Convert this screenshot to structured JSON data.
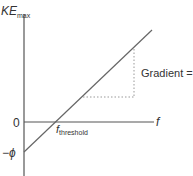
{
  "diagram": {
    "y_axis": {
      "label_main": "KE",
      "label_sub": "max",
      "ticks": [
        {
          "label": "0",
          "value": 0
        },
        {
          "label": "−ϕ",
          "value": "-phi"
        }
      ]
    },
    "x_axis": {
      "label": "f",
      "threshold_main": "f",
      "threshold_sub": "threshold"
    },
    "line": {
      "description": "KE_max = h f − ϕ",
      "y_intercept": "−ϕ",
      "x_intercept": "f_threshold"
    },
    "gradient_annotation": {
      "text": "Gradient = ",
      "symbol": "h"
    },
    "colors": {
      "axis": "#555555",
      "line": "#666666",
      "dotted": "#999999",
      "text": "#333333"
    }
  }
}
